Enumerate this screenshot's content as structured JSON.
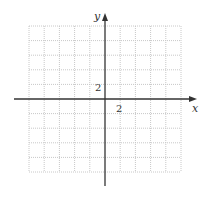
{
  "graph": {
    "x_axis_label": "x",
    "y_axis_label": "y",
    "x_tick_label": "2",
    "y_tick_label": "2",
    "grid": {
      "columns": 10,
      "rows": 10,
      "spacing_units": 1,
      "style": "dotted"
    },
    "x_range": [
      -10,
      10
    ],
    "y_range": [
      -10,
      10
    ],
    "colors": {
      "axis": "#333333",
      "grid": "#c8c8c8"
    }
  }
}
